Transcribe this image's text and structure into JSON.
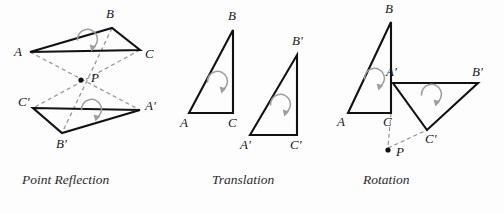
{
  "figure": {
    "background_color": "#fdfdfd",
    "line_color": "#121212",
    "dashed_color": "#9a9a9a",
    "arrow_color": "#9d9d9d",
    "width": 504,
    "height": 213
  },
  "panels": [
    {
      "id": "point-reflection",
      "caption": "Point Reflection",
      "caption_x": 22,
      "caption_y": 184,
      "center_point": {
        "label": "P",
        "x": 81,
        "y": 80,
        "label_x": 91,
        "label_y": 82
      },
      "preimage": {
        "name": "triangle-ABC",
        "vertices": [
          {
            "label": "A",
            "x": 30,
            "y": 52,
            "label_x": 14,
            "label_y": 56
          },
          {
            "label": "B",
            "x": 112,
            "y": 28,
            "label_x": 106,
            "label_y": 18
          },
          {
            "label": "C",
            "x": 140,
            "y": 50,
            "label_x": 145,
            "label_y": 58
          }
        ],
        "rotation_arrow": {
          "cx": 84,
          "cy": 46,
          "r": 10,
          "direction": "clockwise"
        }
      },
      "image": {
        "name": "triangle-A-prime-B-prime-C-prime",
        "vertices": [
          {
            "label": "C'",
            "x": 33,
            "y": 108,
            "label_x": 18,
            "label_y": 106
          },
          {
            "label": "A'",
            "x": 140,
            "y": 110,
            "label_x": 145,
            "label_y": 110
          },
          {
            "label": "B'",
            "x": 62,
            "y": 133,
            "label_x": 56,
            "label_y": 148
          }
        ],
        "rotation_arrow": {
          "cx": 88,
          "cy": 116,
          "r": 10,
          "direction": "clockwise"
        }
      },
      "connector_lines": [
        {
          "name": "A-to-A-prime",
          "from": [
            30,
            52
          ],
          "to": [
            140,
            110
          ]
        },
        {
          "name": "B-to-B-prime",
          "from": [
            112,
            28
          ],
          "to": [
            62,
            133
          ]
        },
        {
          "name": "C-to-C-prime",
          "from": [
            140,
            50
          ],
          "to": [
            33,
            108
          ]
        }
      ]
    },
    {
      "id": "translation",
      "caption": "Translation",
      "caption_x": 212,
      "caption_y": 184,
      "preimage": {
        "name": "triangle-ABC",
        "vertices": [
          {
            "label": "A",
            "x": 189,
            "y": 113,
            "label_x": 180,
            "label_y": 127
          },
          {
            "label": "B",
            "x": 233,
            "y": 30,
            "label_x": 228,
            "label_y": 20
          },
          {
            "label": "C",
            "x": 233,
            "y": 113,
            "label_x": 228,
            "label_y": 127
          }
        ],
        "rotation_arrow": {
          "cx": 214,
          "cy": 88,
          "r": 10,
          "direction": "clockwise"
        }
      },
      "image": {
        "name": "triangle-A-prime-B-prime-C-prime",
        "vertices": [
          {
            "label": "A'",
            "x": 250,
            "y": 135,
            "label_x": 240,
            "label_y": 149
          },
          {
            "label": "B'",
            "x": 297,
            "y": 55,
            "label_x": 292,
            "label_y": 45
          },
          {
            "label": "C'",
            "x": 297,
            "y": 135,
            "label_x": 290,
            "label_y": 149
          }
        ],
        "rotation_arrow": {
          "cx": 277,
          "cy": 111,
          "r": 10,
          "direction": "clockwise"
        }
      }
    },
    {
      "id": "rotation",
      "caption": "Rotation",
      "caption_x": 363,
      "caption_y": 184,
      "center_point": {
        "label": "P",
        "x": 388,
        "y": 150,
        "label_x": 396,
        "label_y": 156
      },
      "preimage": {
        "name": "triangle-ABC",
        "vertices": [
          {
            "label": "A",
            "x": 348,
            "y": 113,
            "label_x": 337,
            "label_y": 126
          },
          {
            "label": "B",
            "x": 391,
            "y": 22,
            "label_x": 385,
            "label_y": 13
          },
          {
            "label": "C",
            "x": 391,
            "y": 113,
            "label_x": 383,
            "label_y": 126
          }
        ],
        "rotation_arrow": {
          "cx": 371,
          "cy": 85,
          "r": 10,
          "direction": "clockwise"
        }
      },
      "image": {
        "name": "triangle-A-prime-B-prime-C-prime",
        "vertices": [
          {
            "label": "A'",
            "x": 393,
            "y": 83,
            "label_x": 386,
            "label_y": 76
          },
          {
            "label": "B'",
            "x": 478,
            "y": 83,
            "label_x": 472,
            "label_y": 76
          },
          {
            "label": "C'",
            "x": 427,
            "y": 130,
            "label_x": 425,
            "label_y": 143
          }
        ],
        "rotation_arrow": {
          "cx": 428,
          "cy": 101,
          "r": 10,
          "direction": "clockwise"
        }
      },
      "connector_lines": [
        {
          "name": "C-to-P",
          "from": [
            391,
            113
          ],
          "to": [
            388,
            148
          ]
        },
        {
          "name": "P-to-C-prime",
          "from": [
            388,
            148
          ],
          "to": [
            427,
            130
          ]
        }
      ]
    }
  ]
}
